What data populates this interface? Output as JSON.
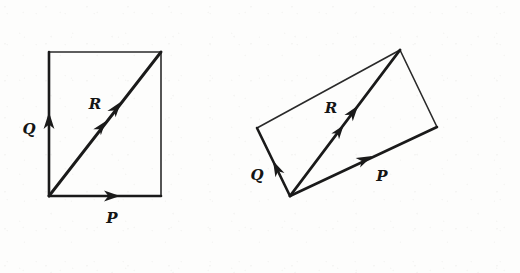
{
  "figure": {
    "caption": "",
    "background_color": "#fdfdfc",
    "ink_color": "#1a1a1a",
    "panels": [
      {
        "id": "left-panel",
        "name": "rectangle-construction",
        "shape": "rectangle",
        "vertices": {
          "origin": [
            49,
            196
          ],
          "top_left": [
            49,
            52
          ],
          "top_right": [
            161,
            52
          ],
          "bottom_right": [
            161,
            196
          ]
        },
        "vectors": [
          {
            "name": "P",
            "label": "P",
            "label_pos": [
              112,
              219
            ],
            "from": [
              49,
              196
            ],
            "to": [
              161,
              196
            ],
            "arrow_at": [
              113,
              196
            ],
            "arrow_angle": 0,
            "description": "horizontal vector along bottom edge pointing right"
          },
          {
            "name": "Q",
            "label": "Q",
            "label_pos": [
              30,
              129
            ],
            "from": [
              49,
              196
            ],
            "to": [
              49,
              52
            ],
            "arrow_at": [
              49,
              117
            ],
            "arrow_angle": -90,
            "description": "vertical vector along left edge pointing up"
          },
          {
            "name": "R",
            "label": "R",
            "label_pos": [
              95,
              104
            ],
            "from": [
              49,
              196
            ],
            "to": [
              161,
              52
            ],
            "arrow_at": [
              113,
              112
            ],
            "arrow_at_2": [
              101,
              127
            ],
            "arrow_angle": -52,
            "description": "resultant diagonal vector with double arrowhead"
          }
        ]
      },
      {
        "id": "right-panel",
        "name": "oblique-parallelogram-construction",
        "shape": "parallelogram",
        "vertices": {
          "origin": [
            290,
            196
          ],
          "left": [
            257,
            128
          ],
          "top": [
            400,
            50
          ],
          "right": [
            437,
            127
          ]
        },
        "vectors": [
          {
            "name": "P",
            "label": "P",
            "label_pos": [
              381,
              175
            ],
            "from": [
              290,
              196
            ],
            "to": [
              437,
              127
            ],
            "arrow_at": [
              362,
              161
            ],
            "arrow_angle": -25,
            "description": "vector along lower-right edge pointing up-right"
          },
          {
            "name": "Q",
            "label": "Q",
            "label_pos": [
              258,
              175
            ],
            "from": [
              290,
              196
            ],
            "to": [
              257,
              128
            ],
            "arrow_at": [
              274,
              162
            ],
            "arrow_angle": -116,
            "description": "vector along lower-left edge pointing up-left"
          },
          {
            "name": "R",
            "label": "R",
            "label_pos": [
              331,
              108
            ],
            "from": [
              290,
              196
            ],
            "to": [
              400,
              50
            ],
            "arrow_at": [
              350,
              116
            ],
            "arrow_at_2": [
              338,
              132
            ],
            "arrow_angle": -53,
            "description": "resultant diagonal vector with double arrowhead"
          }
        ]
      }
    ]
  }
}
